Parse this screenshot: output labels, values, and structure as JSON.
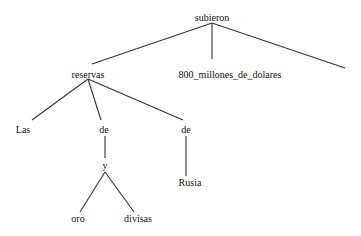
{
  "diagram": {
    "type": "dependency-tree",
    "line_color": "#333333",
    "nodes": [
      {
        "id": "subieron",
        "label": "subieron",
        "x": 212,
        "y": 18
      },
      {
        "id": "reservas",
        "label": "reservas",
        "x": 88,
        "y": 75
      },
      {
        "id": "millones",
        "label": "800_millones_de_dolares",
        "x": 230,
        "y": 75
      },
      {
        "id": "las",
        "label": "Las",
        "x": 23,
        "y": 130
      },
      {
        "id": "de1",
        "label": "de",
        "x": 104,
        "y": 130
      },
      {
        "id": "de2",
        "label": "de",
        "x": 186,
        "y": 130
      },
      {
        "id": "y",
        "label": "y",
        "x": 105,
        "y": 167
      },
      {
        "id": "rusia",
        "label": "Rusia",
        "x": 190,
        "y": 183
      },
      {
        "id": "oro",
        "label": "oro",
        "x": 78,
        "y": 219
      },
      {
        "id": "divisas",
        "label": "divisas",
        "x": 138,
        "y": 219
      }
    ],
    "edges": [
      {
        "from": "subieron",
        "to": "reservas"
      },
      {
        "from": "subieron",
        "to": "millones"
      },
      {
        "from": "subieron",
        "to": "(unlabeled)"
      },
      {
        "from": "reservas",
        "to": "las"
      },
      {
        "from": "reservas",
        "to": "de1"
      },
      {
        "from": "reservas",
        "to": "de2"
      },
      {
        "from": "de1",
        "to": "y"
      },
      {
        "from": "de2",
        "to": "rusia"
      },
      {
        "from": "y",
        "to": "oro"
      },
      {
        "from": "y",
        "to": "divisas"
      }
    ]
  }
}
